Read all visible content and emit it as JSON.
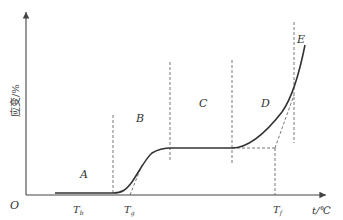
{
  "diagram": {
    "title": "",
    "axes": {
      "origin_label": "O",
      "x_label": "t/℃",
      "y_label": "应变/%"
    },
    "regions": [
      {
        "id": "A",
        "label": "A"
      },
      {
        "id": "B",
        "label": "B"
      },
      {
        "id": "C",
        "label": "C"
      },
      {
        "id": "D",
        "label": "D"
      },
      {
        "id": "E",
        "label": "E"
      }
    ],
    "temperature_marks": [
      {
        "id": "Tb",
        "symbol": "T",
        "subscript": "b"
      },
      {
        "id": "Tg",
        "symbol": "T",
        "subscript": "g"
      },
      {
        "id": "Tf",
        "symbol": "T",
        "subscript": "f"
      }
    ],
    "colors": {
      "curve": "#333333",
      "axis": "#444444",
      "dashed": "#555555"
    }
  }
}
